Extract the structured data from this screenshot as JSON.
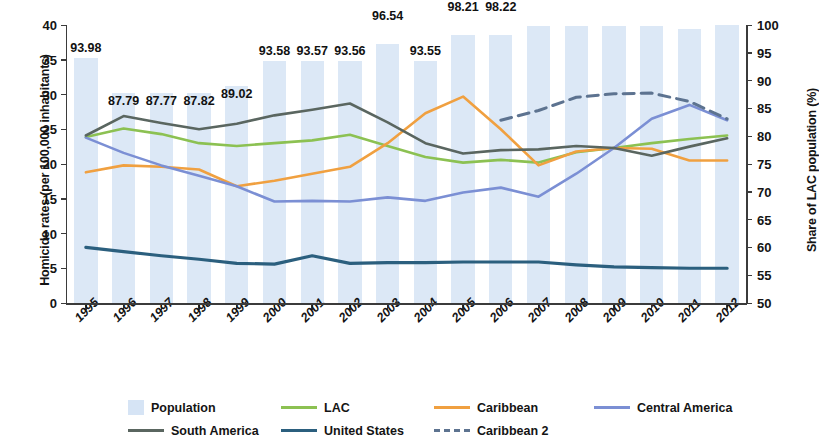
{
  "axes": {
    "y_left_title": "Homicide rates (per 100,000 inhabitants)",
    "y_right_title": "Share of LAC population (%)",
    "y_left_ticks": [
      "40",
      "35",
      "30",
      "25",
      "20",
      "15",
      "10",
      "5",
      "0"
    ],
    "y_right_ticks": [
      "100",
      "95",
      "90",
      "85",
      "80",
      "75",
      "70",
      "65",
      "60",
      "55",
      "50"
    ],
    "x_ticks": [
      "1995",
      "1996",
      "1997",
      "1998",
      "1999",
      "2000",
      "2001",
      "2002",
      "2003",
      "2004",
      "2005",
      "2006",
      "2007",
      "2008",
      "2009",
      "2010",
      "2011",
      "2012"
    ]
  },
  "legend": {
    "row1": [
      {
        "label": "Population",
        "type": "box",
        "color": "#d6e4f5"
      },
      {
        "label": "LAC",
        "type": "line",
        "color": "#8cc152"
      },
      {
        "label": "Caribbean",
        "type": "line",
        "color": "#f0a040"
      },
      {
        "label": "Central America",
        "type": "line",
        "color": "#7b8fd4"
      }
    ],
    "row2": [
      {
        "label": "South America",
        "type": "line",
        "color": "#5a6660"
      },
      {
        "label": "United States",
        "type": "line",
        "color": "#2b5f7e"
      },
      {
        "label": "Caribbean 2",
        "type": "dash",
        "color": "#5d7390"
      }
    ]
  },
  "bar_labels": [
    "93.98",
    "87.79",
    "87.77",
    "87.82",
    "89.02",
    "93.58",
    "93.57",
    "93.56",
    "96.54",
    "93.55",
    "98.21",
    "98.22",
    "99.90",
    "99.91",
    "99.91",
    "99.90",
    "99.21",
    "99.96"
  ],
  "chart_data": {
    "type": "line",
    "title": "",
    "xlabel": "",
    "ylabel": "Homicide rates (per 100,000 inhabitants)",
    "y2label": "Share of LAC population (%)",
    "ylim": [
      0,
      40
    ],
    "y2lim": [
      50,
      100
    ],
    "grid": false,
    "legend_position": "bottom",
    "x": [
      "1995",
      "1996",
      "1997",
      "1998",
      "1999",
      "2000",
      "2001",
      "2002",
      "2003",
      "2004",
      "2005",
      "2006",
      "2007",
      "2008",
      "2009",
      "2010",
      "2011",
      "2012"
    ],
    "bars": {
      "name": "Population",
      "axis": "right",
      "unit": "%",
      "color": "#d6e4f5",
      "values": [
        93.98,
        87.79,
        87.77,
        87.82,
        89.02,
        93.58,
        93.57,
        93.56,
        96.54,
        93.55,
        98.21,
        98.22,
        99.9,
        99.91,
        99.91,
        99.9,
        99.21,
        99.96
      ]
    },
    "series": [
      {
        "name": "LAC",
        "axis": "left",
        "color": "#8cc152",
        "style": "solid",
        "values": [
          23.9,
          25.1,
          24.3,
          23.0,
          22.6,
          23.0,
          23.4,
          24.2,
          22.6,
          21.0,
          20.2,
          20.6,
          20.2,
          21.7,
          22.3,
          23.0,
          23.6,
          24.1
        ]
      },
      {
        "name": "Caribbean",
        "axis": "left",
        "color": "#f0a040",
        "style": "solid",
        "values": [
          18.8,
          19.8,
          19.6,
          19.2,
          16.8,
          17.6,
          18.6,
          19.6,
          23.0,
          27.3,
          29.7,
          25.0,
          19.8,
          21.8,
          22.3,
          22.2,
          20.5,
          20.5
        ]
      },
      {
        "name": "Central America",
        "axis": "left",
        "color": "#7b8fd4",
        "style": "solid",
        "values": [
          23.8,
          21.6,
          19.8,
          18.3,
          16.8,
          14.6,
          14.7,
          14.6,
          15.2,
          14.7,
          15.9,
          16.6,
          15.3,
          18.6,
          22.3,
          26.5,
          28.5,
          26.3
        ]
      },
      {
        "name": "South America",
        "axis": "left",
        "color": "#5a6660",
        "style": "solid",
        "values": [
          24.1,
          26.9,
          25.9,
          25.0,
          25.8,
          27.0,
          27.8,
          28.7,
          26.0,
          23.0,
          21.5,
          22.0,
          22.1,
          22.6,
          22.3,
          21.2,
          22.5,
          23.7
        ]
      },
      {
        "name": "United States",
        "axis": "left",
        "color": "#2b5f7e",
        "style": "solid",
        "values": [
          8.0,
          7.4,
          6.8,
          6.3,
          5.7,
          5.6,
          6.8,
          5.7,
          5.8,
          5.8,
          5.9,
          5.9,
          5.9,
          5.5,
          5.2,
          5.1,
          5.0,
          5.0
        ]
      },
      {
        "name": "Caribbean 2",
        "axis": "left",
        "color": "#5d7390",
        "style": "dashed",
        "start_index": 11,
        "values": [
          null,
          null,
          null,
          null,
          null,
          null,
          null,
          null,
          null,
          null,
          null,
          26.3,
          27.7,
          29.6,
          30.1,
          30.2,
          29.0,
          26.5
        ]
      }
    ]
  }
}
